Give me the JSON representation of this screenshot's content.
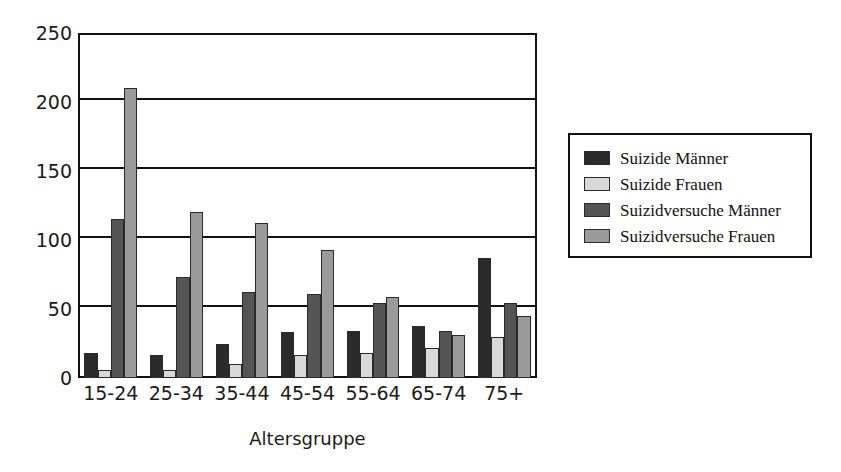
{
  "chart_data": {
    "type": "bar",
    "title": "",
    "subtitle": "",
    "xlabel": "Altersgruppe",
    "ylabel": "",
    "categories": [
      "15-24",
      "25-34",
      "35-44",
      "45-54",
      "55-64",
      "65-74",
      "75+"
    ],
    "series": [
      {
        "name": "Suizide Männer",
        "color": "#2b2b2b",
        "values": [
          18,
          17,
          25,
          33,
          34,
          38,
          87
        ]
      },
      {
        "name": "Suizide Frauen",
        "color": "#d9d9d9",
        "values": [
          6,
          6,
          10,
          17,
          18,
          22,
          30
        ]
      },
      {
        "name": "Suizidversuche Männer",
        "color": "#555555",
        "values": [
          115,
          73,
          62,
          61,
          54,
          34,
          54
        ]
      },
      {
        "name": "Suizidversuche Frauen",
        "color": "#9a9a9a",
        "values": [
          210,
          120,
          112,
          93,
          59,
          31,
          45
        ]
      }
    ],
    "ylim": [
      0,
      250
    ],
    "yticks": [
      0,
      50,
      100,
      150,
      200,
      250
    ],
    "grid": true,
    "legend_position": "right-outside"
  },
  "legend": {
    "entries": [
      {
        "label": "Suizide Männer"
      },
      {
        "label": "Suizide Frauen"
      },
      {
        "label": "Suizidversuche Männer"
      },
      {
        "label": "Suizidversuche Frauen"
      }
    ]
  },
  "axes": {
    "x_title": "Altersgruppe",
    "x_ticks": [
      "15-24",
      "25-34",
      "35-44",
      "45-54",
      "55-64",
      "65-74",
      "75+"
    ],
    "y_ticks": [
      "0",
      "50",
      "100",
      "150",
      "200",
      "250"
    ]
  },
  "colors": {
    "frame": "#111111",
    "background": "#ffffff",
    "series_1": "#2b2b2b",
    "series_2": "#d9d9d9",
    "series_3": "#555555",
    "series_4": "#9a9a9a"
  }
}
